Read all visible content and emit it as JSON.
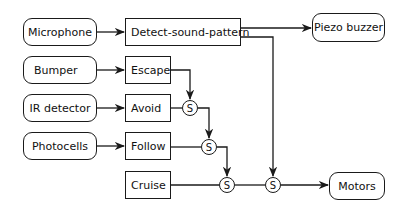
{
  "diagram": {
    "type": "subsumption-architecture",
    "sensors": [
      {
        "id": "microphone",
        "label": "Microphone"
      },
      {
        "id": "bumper",
        "label": "Bumper"
      },
      {
        "id": "ir_detector",
        "label": "IR detector"
      },
      {
        "id": "photocells",
        "label": "Photocells"
      }
    ],
    "behaviors": [
      {
        "id": "detect_sound",
        "label": "Detect-sound-pattern"
      },
      {
        "id": "escape",
        "label": "Escape"
      },
      {
        "id": "avoid",
        "label": "Avoid"
      },
      {
        "id": "follow",
        "label": "Follow"
      },
      {
        "id": "cruise",
        "label": "Cruise"
      }
    ],
    "actuators": [
      {
        "id": "piezo",
        "label": "Piezo buzzer"
      },
      {
        "id": "motors",
        "label": "Motors"
      }
    ],
    "suppressors": [
      {
        "id": "s1",
        "label": "S"
      },
      {
        "id": "s2",
        "label": "S"
      },
      {
        "id": "s3",
        "label": "S"
      },
      {
        "id": "s4",
        "label": "S"
      }
    ],
    "edges": [
      {
        "from": "microphone",
        "to": "detect_sound"
      },
      {
        "from": "detect_sound",
        "to": "piezo"
      },
      {
        "from": "detect_sound",
        "to": "s4",
        "type": "suppress"
      },
      {
        "from": "bumper",
        "to": "escape"
      },
      {
        "from": "escape",
        "to": "s1",
        "type": "suppress"
      },
      {
        "from": "ir_detector",
        "to": "avoid"
      },
      {
        "from": "avoid",
        "to": "s1"
      },
      {
        "from": "s1",
        "to": "s2",
        "type": "suppress"
      },
      {
        "from": "photocells",
        "to": "follow"
      },
      {
        "from": "follow",
        "to": "s2"
      },
      {
        "from": "s2",
        "to": "s3",
        "type": "suppress"
      },
      {
        "from": "cruise",
        "to": "s3"
      },
      {
        "from": "s3",
        "to": "s4"
      },
      {
        "from": "s4",
        "to": "motors"
      }
    ],
    "colors": {
      "stroke": "#1a1a1a",
      "fill": "#ffffff",
      "text": "#111111"
    }
  }
}
